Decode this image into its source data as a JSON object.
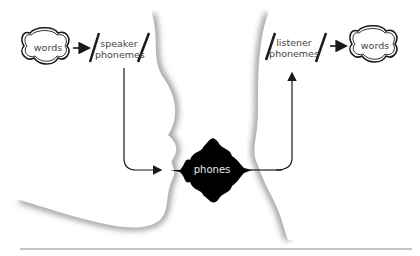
{
  "diagram": {
    "speaker": {
      "words_label": "words",
      "phonemes_line1": "speaker",
      "phonemes_line2": "phonemes"
    },
    "listener": {
      "words_label": "words",
      "phonemes_line1": "listener",
      "phonemes_line2": "phonemes"
    },
    "channel": {
      "label": "phones"
    },
    "colors": {
      "ink": "#1a1a1a",
      "shadow": "#9a9a9a",
      "blob": "#000000",
      "rule": "#888888"
    }
  }
}
